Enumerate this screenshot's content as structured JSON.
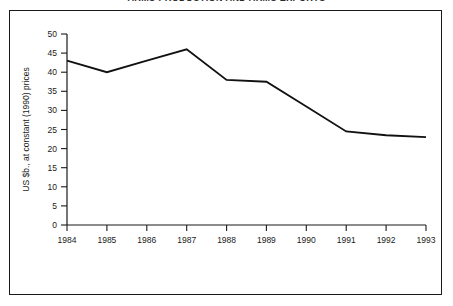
{
  "figure": {
    "title": "ARMS PRODUCTION AND ARMS EXPORTS",
    "background_color": "#ffffff",
    "frame_color": "#1a1a1a",
    "line_color": "#111111"
  },
  "chart_data": {
    "type": "line",
    "title": "ARMS PRODUCTION AND ARMS EXPORTS",
    "xlabel": "",
    "ylabel": "US $b., at constant (1990) prices",
    "categories": [
      "1984",
      "1985",
      "1986",
      "1987",
      "1988",
      "1989",
      "1990",
      "1991",
      "1992",
      "1993"
    ],
    "x": [
      1984,
      1985,
      1986,
      1987,
      1988,
      1989,
      1990,
      1991,
      1992,
      1993
    ],
    "values": [
      43,
      40,
      43,
      46,
      38,
      37.5,
      31,
      24.5,
      23.5,
      23
    ],
    "series": [
      {
        "name": "US $b., at constant (1990) prices",
        "values": [
          43,
          40,
          43,
          46,
          38,
          37.5,
          31,
          24.5,
          23.5,
          23
        ]
      }
    ],
    "ylim": [
      0,
      50
    ],
    "yticks": [
      0,
      5,
      10,
      15,
      20,
      25,
      30,
      35,
      40,
      45,
      50
    ],
    "ytick_labels": [
      "0",
      "5",
      "10",
      "15",
      "20",
      "25",
      "30",
      "35",
      "40",
      "45",
      "50"
    ],
    "xtick_labels": [
      "1984",
      "1985",
      "1986",
      "1987",
      "1988",
      "1989",
      "1990",
      "1991",
      "1992",
      "1993"
    ],
    "grid": false,
    "legend": "none",
    "line_color": "#111111"
  }
}
